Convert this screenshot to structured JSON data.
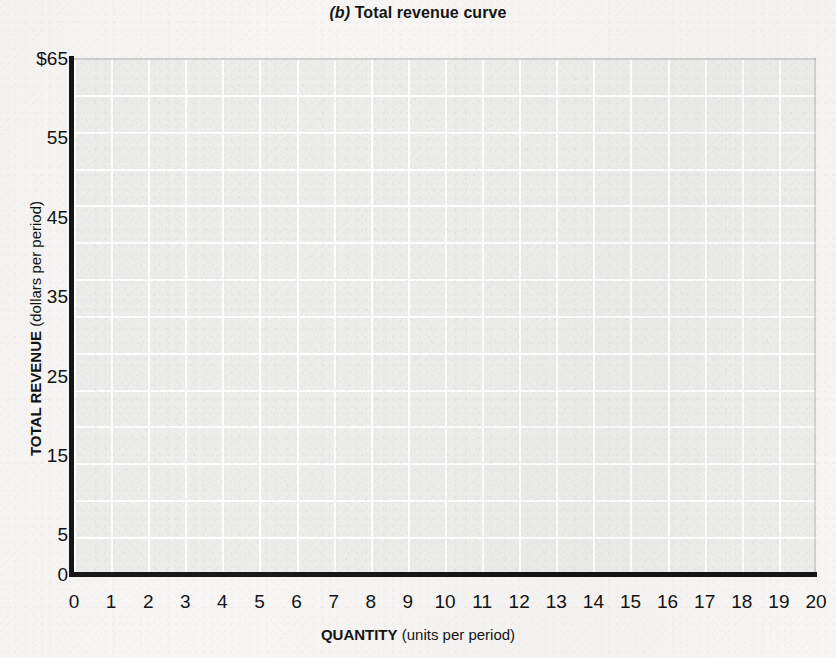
{
  "chart_data": {
    "type": "line",
    "title_prefix": "(b)",
    "title_text": "Total revenue curve",
    "xlabel_strong": "QUANTITY",
    "xlabel_paren": "(units per period)",
    "xlabel": "QUANTITY (units per period)",
    "ylabel_strong": "TOTAL REVENUE",
    "ylabel_paren": "(dollars per period)",
    "ylabel": "TOTAL REVENUE (dollars per period)",
    "xlim": [
      0,
      20
    ],
    "ylim": [
      0,
      65
    ],
    "xticks": [
      "0",
      "1",
      "2",
      "3",
      "4",
      "5",
      "6",
      "7",
      "8",
      "9",
      "10",
      "11",
      "12",
      "13",
      "14",
      "15",
      "16",
      "17",
      "18",
      "19",
      "20"
    ],
    "xtick_values": [
      0,
      1,
      2,
      3,
      4,
      5,
      6,
      7,
      8,
      9,
      10,
      11,
      12,
      13,
      14,
      15,
      16,
      17,
      18,
      19,
      20
    ],
    "yticks": [
      "$65",
      "55",
      "45",
      "35",
      "25",
      "15",
      "5",
      "0"
    ],
    "ytick_values": [
      65,
      55,
      45,
      35,
      25,
      15,
      5,
      0
    ],
    "grid": true,
    "grid_x_step": 1,
    "grid_y_step": 5,
    "legend": null,
    "series": [],
    "values": [],
    "annotations": [],
    "note": "Blank worksheet grid — no data plotted"
  },
  "colors": {
    "page_background": "#f7f6f4",
    "plot_background": "#ededec",
    "gridline": "#ffffff",
    "axis_line": "#141414",
    "text": "#111111"
  }
}
